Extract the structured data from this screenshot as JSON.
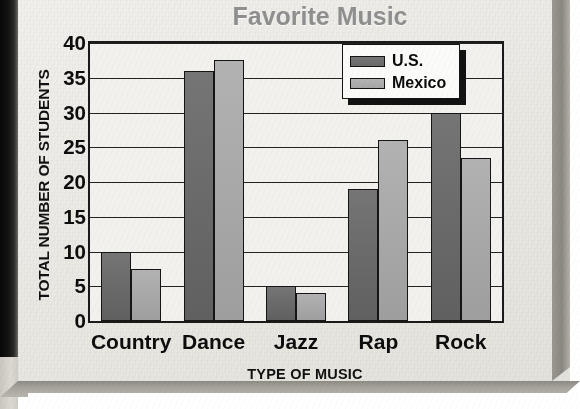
{
  "chart_data": {
    "type": "bar",
    "title": "Favorite Music",
    "xlabel": "TYPE OF MUSIC",
    "ylabel": "TOTAL NUMBER OF STUDENTS",
    "categories": [
      "Country",
      "Dance",
      "Jazz",
      "Rap",
      "Rock"
    ],
    "series": [
      {
        "name": "U.S.",
        "color": "#6d6d6d",
        "values": [
          10,
          36,
          5,
          19,
          30
        ]
      },
      {
        "name": "Mexico",
        "color": "#aaaaaa",
        "values": [
          7.5,
          37.5,
          4,
          26,
          23.5
        ]
      }
    ],
    "ylim": [
      0,
      40
    ],
    "yticks": [
      0,
      5,
      10,
      15,
      20,
      25,
      30,
      35,
      40
    ],
    "ytick_labels": [
      "0",
      "5",
      "10",
      "15",
      "20",
      "25",
      "30",
      "35",
      "40"
    ],
    "grid": true,
    "legend_position": "top-right-inside"
  },
  "legend": {
    "entries": [
      {
        "label": "U.S.",
        "swatch": "dark-gray-swatch"
      },
      {
        "label": "Mexico",
        "swatch": "light-gray-swatch"
      }
    ]
  },
  "colors": {
    "title": "#8f8f8f",
    "axis": "#1a1a1a",
    "us_bar": "#6d6d6d",
    "mexico_bar": "#aaaaaa",
    "page": "#eceae5"
  }
}
